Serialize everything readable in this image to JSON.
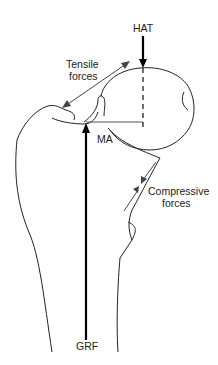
{
  "figure": {
    "labels": {
      "hat": "HAT",
      "tensile_line1": "Tensile",
      "tensile_line2": "forces",
      "moment_arm": "MA",
      "compressive_line1": "Compressive",
      "compressive_line2": "forces",
      "grf": "GRF"
    },
    "colors": {
      "outline": "#222222",
      "force_arrow": "#000000",
      "thin_arrow": "#444444",
      "background": "#ffffff"
    }
  }
}
